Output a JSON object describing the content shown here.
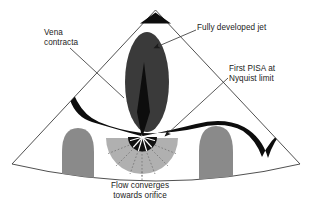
{
  "figure": {
    "kind": "echocardiography-sector-diagram",
    "background": "#ffffff"
  },
  "labels": {
    "vena_contracta": "Vena\ncontracta",
    "fully_developed_jet": "Fully developed jet",
    "first_pisa": "First PISA at\nNyquist limit",
    "flow_converges": "Flow converges\ntowards orifice"
  },
  "colors": {
    "outline": "#3c3c3c",
    "ink": "#1b1b1b",
    "jet_fill": "#3a3a3a",
    "jet_core": "#0d0d0d",
    "leaflet": "#0d0d0d",
    "myocardium": "#8a8a8a",
    "pisa_shell": "#b0b0b0",
    "pisa_core": "#111111",
    "flow_line": "#6e6e6e",
    "page": "#ffffff"
  },
  "parts": {
    "sector": "ultrasound-sector-outline",
    "transducer_marker": "transducer-wedge",
    "jet": "regurgitant-jet-ellipse",
    "jet_core": "jet-core-spike",
    "leaflet_left": "valve-leaflet-left",
    "leaflet_right": "valve-leaflet-right",
    "myocardium_left": "myocardial-wall-left",
    "myocardium_right": "myocardial-wall-right",
    "pisa_shell": "pisa-hemisphere",
    "pisa_core": "orifice-core-hemisphere",
    "flow_lines": "flow-convergence-streamlines",
    "leader_vena": "leader-line-vena-contracta",
    "leader_jet": "leader-line-fully-developed-jet",
    "leader_pisa": "leader-line-first-pisa",
    "leader_flow": "leader-line-flow-converges"
  }
}
